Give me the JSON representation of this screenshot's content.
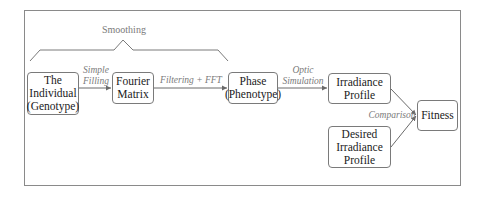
{
  "diagram": {
    "group_label": "Smoothing",
    "nodes": {
      "individual": {
        "line1": "The",
        "line2": "Individual",
        "line3": "(Genotype)"
      },
      "fourier": {
        "line1": "Fourier",
        "line2": "Matrix"
      },
      "phase": {
        "line1": "Phase",
        "line2": "(Phenotype)"
      },
      "irradiance": {
        "line1": "Irradiance",
        "line2": "Profile"
      },
      "desired": {
        "line1": "Desired",
        "line2": "Irradiance",
        "line3": "Profile"
      },
      "fitness": {
        "line1": "Fitness"
      }
    },
    "edges": {
      "simple_filling": {
        "line1": "Simple",
        "line2": "Filling"
      },
      "filtering_fft": {
        "line1": "Filtering + FFT"
      },
      "optic_simulation": {
        "line1": "Optic",
        "line2": "Simulation"
      },
      "comparison": {
        "line1": "Comparison"
      }
    },
    "colors": {
      "border": "#7a7a7a",
      "label": "#7a7a7a",
      "text": "#1a1a1a"
    }
  }
}
